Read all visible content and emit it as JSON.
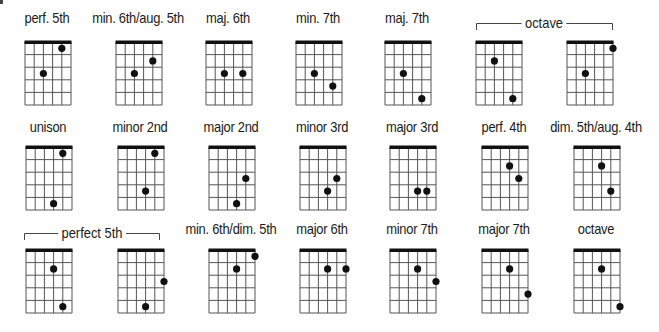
{
  "figure": {
    "strings": 6,
    "frets": 5,
    "colors": {
      "lines": "#555555",
      "nut": "#111111",
      "dots": "#111111",
      "text": "#1a1a1a"
    }
  },
  "rows": [
    {
      "top": 41,
      "label_y": 9,
      "lefts": [
        24,
        115,
        205,
        295,
        384,
        475,
        566
      ],
      "diagrams": [
        {
          "label": "perf. 5th",
          "dots": [
            [
              5,
              1
            ],
            [
              3,
              3
            ]
          ]
        },
        {
          "label": "min. 6th/aug. 5th",
          "dots": [
            [
              5,
              2
            ],
            [
              3,
              3
            ]
          ]
        },
        {
          "label": "maj. 6th",
          "dots": [
            [
              3,
              3
            ],
            [
              5,
              3
            ]
          ]
        },
        {
          "label": "min. 7th",
          "dots": [
            [
              3,
              3
            ],
            [
              5,
              4
            ]
          ]
        },
        {
          "label": "maj. 7th",
          "dots": [
            [
              3,
              3
            ],
            [
              5,
              5
            ]
          ]
        },
        {
          "label": "",
          "dots": [
            [
              3,
              2
            ],
            [
              5,
              5
            ]
          ]
        },
        {
          "label": "",
          "dots": [
            [
              6,
              1
            ],
            [
              3,
              3
            ]
          ]
        }
      ],
      "bracket": {
        "label": "octave",
        "x1": 476,
        "x2": 612,
        "y": 23
      }
    },
    {
      "top": 146,
      "label_y": 118,
      "lefts": [
        25,
        117,
        208,
        299,
        389,
        481,
        573
      ],
      "diagrams": [
        {
          "label": "unison",
          "dots": [
            [
              5,
              1
            ],
            [
              4,
              5
            ]
          ]
        },
        {
          "label": "minor 2nd",
          "dots": [
            [
              5,
              1
            ],
            [
              4,
              4
            ]
          ]
        },
        {
          "label": "major 2nd",
          "dots": [
            [
              5,
              3
            ],
            [
              4,
              5
            ]
          ]
        },
        {
          "label": "minor 3rd",
          "dots": [
            [
              5,
              3
            ],
            [
              4,
              4
            ]
          ]
        },
        {
          "label": "major 3rd",
          "dots": [
            [
              4,
              4
            ],
            [
              5,
              4
            ]
          ]
        },
        {
          "label": "perf. 4th",
          "dots": [
            [
              4,
              2
            ],
            [
              5,
              3
            ]
          ]
        },
        {
          "label": "dim. 5th/aug. 4th",
          "dots": [
            [
              4,
              2
            ],
            [
              5,
              4
            ]
          ]
        }
      ]
    },
    {
      "top": 249,
      "label_y": 220,
      "lefts": [
        25,
        117,
        208,
        299,
        389,
        481,
        573
      ],
      "diagrams": [
        {
          "label": "",
          "dots": [
            [
              4,
              2
            ],
            [
              5,
              5
            ]
          ]
        },
        {
          "label": "",
          "dots": [
            [
              6,
              3
            ],
            [
              4,
              5
            ]
          ]
        },
        {
          "label": "min. 6th/dim. 5th",
          "dots": [
            [
              6,
              1
            ],
            [
              4,
              2
            ]
          ]
        },
        {
          "label": "major 6th",
          "dots": [
            [
              4,
              2
            ],
            [
              6,
              2
            ]
          ]
        },
        {
          "label": "minor 7th",
          "dots": [
            [
              4,
              2
            ],
            [
              6,
              3
            ]
          ]
        },
        {
          "label": "major 7th",
          "dots": [
            [
              4,
              2
            ],
            [
              6,
              4
            ]
          ]
        },
        {
          "label": "octave",
          "dots": [
            [
              4,
              2
            ],
            [
              6,
              5
            ]
          ]
        }
      ],
      "bracket": {
        "label": "perfect 5th",
        "x1": 24,
        "x2": 159,
        "y": 233
      }
    }
  ]
}
